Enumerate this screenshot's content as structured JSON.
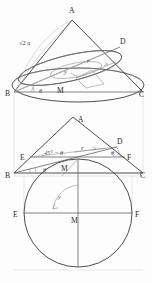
{
  "figure": {
    "background_color": "#fdfdfd",
    "stroke_color": "#3a3a3a",
    "width": 152,
    "height": 283
  },
  "panel_top": {
    "name": "cone-with-inclined-ellipse",
    "labels": {
      "apex": "A",
      "left_base": "B",
      "right_base": "C",
      "upper_right": "D",
      "center": "M",
      "slant_length": "√2 a",
      "radius": "r",
      "angle_theta": "θ",
      "angle_y": "y"
    }
  },
  "panel_middle": {
    "name": "triangle-cross-section",
    "labels": {
      "apex": "A",
      "left_base": "B",
      "right_base": "C",
      "left_mid": "E",
      "right_mid": "F",
      "upper_right": "D",
      "center": "M",
      "radius": "r",
      "angle_complement": "45° − θ",
      "angle_theta": "θ",
      "angle_theta_right": "θ"
    }
  },
  "panel_bottom": {
    "name": "circle-plan-view",
    "labels": {
      "left": "E",
      "center": "M",
      "right": "F",
      "angle_y": "y"
    }
  }
}
